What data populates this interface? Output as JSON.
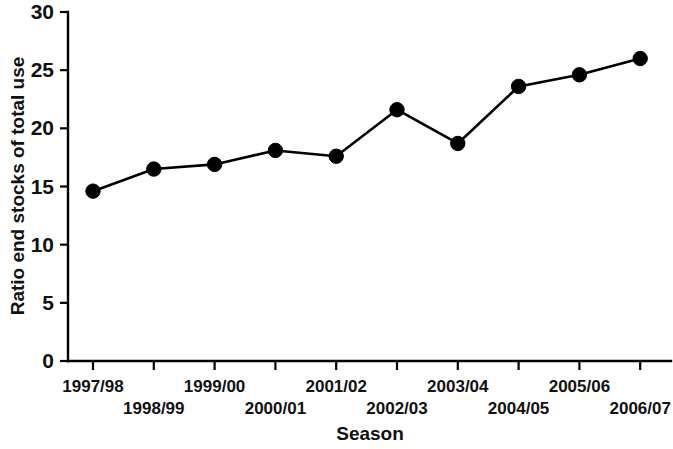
{
  "chart_data": {
    "type": "line",
    "title": "",
    "xlabel": "Season",
    "ylabel": "Ratio end stocks of total use",
    "categories": [
      "1997/98",
      "1998/99",
      "1999/00",
      "2000/01",
      "2001/02",
      "2002/03",
      "2003/04",
      "2004/05",
      "2005/06",
      "2006/07"
    ],
    "values": [
      14.6,
      16.5,
      16.9,
      18.1,
      17.6,
      21.6,
      18.7,
      23.6,
      24.6,
      26.0
    ],
    "series": [
      {
        "name": "Ratio end stocks of total use",
        "values": [
          14.6,
          16.5,
          16.9,
          18.1,
          17.6,
          21.6,
          18.7,
          23.6,
          24.6,
          26.0
        ]
      }
    ],
    "ylim": [
      0,
      30
    ],
    "ytick_labels": [
      "0",
      "5",
      "10",
      "15",
      "20",
      "25",
      "30"
    ],
    "ytick_values": [
      0,
      5,
      10,
      15,
      20,
      25,
      30
    ],
    "grid": false,
    "legend": false,
    "marker": "filled-circle",
    "line_color": "#000000",
    "marker_color": "#000000",
    "background_color": "#ffffff",
    "xtick_label_rows": [
      {
        "row": 0,
        "labels": [
          "1997/98",
          "1999/00",
          "2001/02",
          "2003/04",
          "2005/06"
        ]
      },
      {
        "row": 1,
        "labels": [
          "1998/99",
          "2000/01",
          "2002/03",
          "2004/05",
          "2006/07"
        ]
      }
    ]
  }
}
